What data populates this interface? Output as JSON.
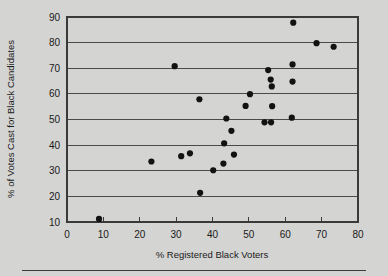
{
  "chart_data": {
    "type": "scatter",
    "title": "",
    "xlabel": "% Registered Black Voters",
    "ylabel": "% of Votes Cast for Black Candidates",
    "xlim": [
      0,
      80
    ],
    "ylim": [
      10,
      90
    ],
    "xticks": [
      "0",
      "10",
      "20",
      "30",
      "40",
      "50",
      "60",
      "70",
      "80"
    ],
    "yticks": [
      "10",
      "20",
      "30",
      "40",
      "50",
      "60",
      "70",
      "80",
      "90"
    ],
    "xtick_values": [
      0,
      10,
      20,
      30,
      40,
      50,
      60,
      70,
      80
    ],
    "ytick_values": [
      10,
      20,
      30,
      40,
      50,
      60,
      70,
      80,
      90
    ],
    "grid": "horizontal",
    "legend": "none",
    "marker": "filled-circle",
    "marker_color": "#121212",
    "points": [
      {
        "x": 8.8,
        "y": 11.2
      },
      {
        "x": 23.2,
        "y": 33.6
      },
      {
        "x": 29.6,
        "y": 70.8
      },
      {
        "x": 31.4,
        "y": 35.7
      },
      {
        "x": 33.8,
        "y": 36.8
      },
      {
        "x": 36.4,
        "y": 57.9
      },
      {
        "x": 36.6,
        "y": 21.4
      },
      {
        "x": 40.2,
        "y": 30.2
      },
      {
        "x": 43.0,
        "y": 32.8
      },
      {
        "x": 43.2,
        "y": 40.7
      },
      {
        "x": 43.8,
        "y": 50.4
      },
      {
        "x": 45.2,
        "y": 45.6
      },
      {
        "x": 45.9,
        "y": 36.3
      },
      {
        "x": 49.1,
        "y": 55.3
      },
      {
        "x": 50.3,
        "y": 59.9
      },
      {
        "x": 54.3,
        "y": 48.9
      },
      {
        "x": 55.3,
        "y": 69.3
      },
      {
        "x": 56.0,
        "y": 65.6
      },
      {
        "x": 56.1,
        "y": 48.9
      },
      {
        "x": 56.3,
        "y": 62.9
      },
      {
        "x": 56.4,
        "y": 55.2
      },
      {
        "x": 61.8,
        "y": 50.7
      },
      {
        "x": 62.0,
        "y": 64.8
      },
      {
        "x": 62.0,
        "y": 71.5
      },
      {
        "x": 62.2,
        "y": 87.8
      },
      {
        "x": 68.6,
        "y": 79.8
      },
      {
        "x": 73.3,
        "y": 78.4
      }
    ]
  },
  "footer": {
    "rule": "horizontal-rule"
  }
}
